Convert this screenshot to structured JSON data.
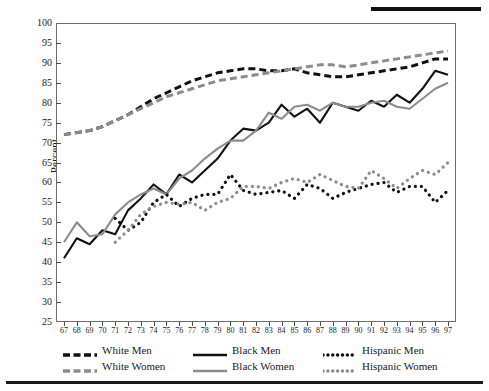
{
  "figure": {
    "ylabel": "Percent",
    "top_rule": true,
    "bottom_rule": true
  },
  "legend": {
    "position": "below-axes",
    "columns": 3,
    "rows": 2,
    "items": [
      {
        "label": "White Men",
        "color": "#111111",
        "style": "dashed",
        "row": 0,
        "col": 0
      },
      {
        "label": "Black Men",
        "color": "#111111",
        "style": "solid",
        "row": 0,
        "col": 1
      },
      {
        "label": "Hispanic Men",
        "color": "#111111",
        "style": "dotted",
        "row": 0,
        "col": 2
      },
      {
        "label": "White Women",
        "color": "#8c8c8c",
        "style": "dashed",
        "row": 1,
        "col": 0
      },
      {
        "label": "Black Women",
        "color": "#8c8c8c",
        "style": "solid",
        "row": 1,
        "col": 1
      },
      {
        "label": "Hispanic Women",
        "color": "#8c8c8c",
        "style": "dotted",
        "row": 1,
        "col": 2
      }
    ]
  },
  "chart_data": {
    "type": "line",
    "title": "",
    "xlabel": "",
    "ylabel": "Percent",
    "grid": false,
    "legend_position": "bottom",
    "xlim": [
      67,
      97
    ],
    "ylim": [
      25,
      100
    ],
    "yticks": [
      25,
      30,
      35,
      40,
      45,
      50,
      55,
      60,
      65,
      70,
      75,
      80,
      85,
      90,
      95,
      100
    ],
    "x": [
      67,
      68,
      69,
      70,
      71,
      72,
      73,
      74,
      75,
      76,
      77,
      78,
      79,
      80,
      81,
      82,
      83,
      84,
      85,
      86,
      87,
      88,
      89,
      90,
      91,
      92,
      93,
      94,
      95,
      96,
      97
    ],
    "xticklabels": [
      "67",
      "68",
      "69",
      "70",
      "71",
      "72",
      "73",
      "74",
      "75",
      "76",
      "77",
      "78",
      "79",
      "80",
      "81",
      "82",
      "83",
      "84",
      "85",
      "86",
      "87",
      "88",
      "89",
      "90",
      "91",
      "92",
      "93",
      "94",
      "95",
      "96",
      "97"
    ],
    "series": [
      {
        "name": "White Men",
        "color": "#111111",
        "style": "dashed",
        "x": [
          67,
          68,
          69,
          70,
          71,
          72,
          73,
          74,
          75,
          76,
          77,
          78,
          79,
          80,
          81,
          82,
          83,
          84,
          85,
          86,
          87,
          88,
          89,
          90,
          91,
          92,
          93,
          94,
          95,
          96,
          97
        ],
        "values": [
          72,
          72.5,
          73,
          74,
          75.5,
          77,
          79,
          81,
          82.5,
          84,
          85.5,
          86.5,
          87.5,
          88,
          88.5,
          88.5,
          88,
          88,
          88.5,
          87.5,
          87,
          86.5,
          86.5,
          87,
          87.5,
          88,
          88.5,
          89,
          90,
          91,
          91
        ]
      },
      {
        "name": "White Women",
        "color": "#8c8c8c",
        "style": "dashed",
        "x": [
          67,
          68,
          69,
          70,
          71,
          72,
          73,
          74,
          75,
          76,
          77,
          78,
          79,
          80,
          81,
          82,
          83,
          84,
          85,
          86,
          87,
          88,
          89,
          90,
          91,
          92,
          93,
          94,
          95,
          96,
          97
        ],
        "values": [
          72,
          72.5,
          73,
          74,
          75.5,
          77,
          78.5,
          80,
          81.5,
          82.5,
          83.5,
          84.5,
          85.5,
          86,
          86.5,
          87,
          87.5,
          88,
          88.5,
          89,
          89.5,
          89.5,
          89,
          89.5,
          90,
          90.5,
          91,
          91.5,
          92,
          92.5,
          93
        ]
      },
      {
        "name": "Black Men",
        "color": "#111111",
        "style": "solid",
        "x": [
          67,
          68,
          69,
          70,
          71,
          72,
          73,
          74,
          75,
          76,
          77,
          78,
          79,
          80,
          81,
          82,
          83,
          84,
          85,
          86,
          87,
          88,
          89,
          90,
          91,
          92,
          93,
          94,
          95,
          96,
          97
        ],
        "values": [
          41,
          46,
          44.5,
          48,
          47,
          53,
          56,
          59.5,
          57,
          62,
          60,
          63,
          66,
          70.5,
          73.5,
          73,
          75,
          79.5,
          76.5,
          78.5,
          75,
          80,
          79,
          78,
          80.5,
          79,
          82,
          80,
          83.5,
          88,
          87
        ]
      },
      {
        "name": "Black Women",
        "color": "#8c8c8c",
        "style": "solid",
        "x": [
          67,
          68,
          69,
          70,
          71,
          72,
          73,
          74,
          75,
          76,
          77,
          78,
          79,
          80,
          81,
          82,
          83,
          84,
          85,
          86,
          87,
          88,
          89,
          90,
          91,
          92,
          93,
          94,
          95,
          96,
          97
        ],
        "values": [
          45,
          50,
          46.5,
          47,
          52,
          55,
          57,
          58.5,
          57,
          61,
          63,
          66,
          68.5,
          70.5,
          70.5,
          73,
          77.5,
          76,
          79,
          79.5,
          78,
          80,
          79,
          79,
          80,
          80.5,
          79,
          78.5,
          81,
          83.5,
          85
        ]
      },
      {
        "name": "Hispanic Men",
        "color": "#111111",
        "style": "dotted",
        "x": [
          71,
          72,
          73,
          74,
          75,
          76,
          77,
          78,
          79,
          80,
          81,
          82,
          83,
          84,
          85,
          86,
          87,
          88,
          89,
          90,
          91,
          92,
          93,
          94,
          95,
          96,
          97
        ],
        "values": [
          51,
          48,
          50,
          55,
          57,
          54,
          56,
          57,
          57,
          62,
          58,
          57,
          57.5,
          58,
          56,
          59.5,
          58.5,
          56,
          57.5,
          58.5,
          59.5,
          60,
          57.5,
          59,
          59,
          55,
          58
        ]
      },
      {
        "name": "Hispanic Women",
        "color": "#8c8c8c",
        "style": "dotted",
        "x": [
          71,
          72,
          73,
          74,
          75,
          76,
          77,
          78,
          79,
          80,
          81,
          82,
          83,
          84,
          85,
          86,
          87,
          88,
          89,
          90,
          91,
          92,
          93,
          94,
          95,
          96,
          97
        ],
        "values": [
          45,
          48,
          52,
          54,
          55,
          54.5,
          55,
          53,
          55,
          56,
          59,
          59,
          58.5,
          60,
          61,
          60,
          62,
          60.5,
          59,
          58.5,
          63,
          61,
          58.5,
          61,
          63,
          62,
          65
        ]
      }
    ]
  }
}
